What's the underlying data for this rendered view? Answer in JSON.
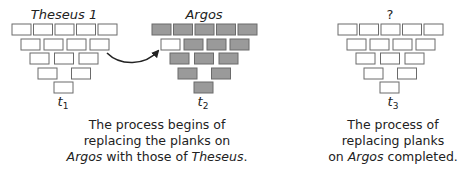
{
  "diagram": {
    "stages": [
      {
        "id": "t1",
        "title": "Theseus 1",
        "title_italic": true,
        "time_label": "t",
        "time_sub": "1",
        "plank_states": [
          [
            "empty",
            "empty",
            "empty",
            "empty",
            "empty"
          ],
          [
            "empty",
            "empty",
            "empty",
            "empty"
          ],
          [
            "empty",
            "empty",
            "empty"
          ],
          [
            "empty",
            "empty"
          ],
          [
            "empty"
          ]
        ]
      },
      {
        "id": "t2",
        "title": "Argos",
        "title_italic": true,
        "time_label": "t",
        "time_sub": "2",
        "plank_states": [
          [
            "filled",
            "filled",
            "filled",
            "filled",
            "filled"
          ],
          [
            "empty",
            "filled",
            "filled",
            "filled"
          ],
          [
            "filled",
            "filled",
            "filled"
          ],
          [
            "filled",
            "filled"
          ],
          [
            "filled"
          ]
        ]
      },
      {
        "id": "t3",
        "title": "?",
        "title_italic": false,
        "time_label": "t",
        "time_sub": "3",
        "plank_states": [
          [
            "empty",
            "empty",
            "empty",
            "empty",
            "empty"
          ],
          [
            "empty",
            "empty",
            "empty",
            "empty"
          ],
          [
            "empty",
            "empty",
            "empty"
          ],
          [
            "empty",
            "empty"
          ],
          [
            "empty"
          ]
        ]
      }
    ],
    "arrow": {
      "from": "t1",
      "to": "t2",
      "label": ""
    },
    "captions": [
      {
        "lines": [
          [
            {
              "text": "The process begins of",
              "italic": false
            }
          ],
          [
            {
              "text": "replacing the planks on",
              "italic": false
            }
          ],
          [
            {
              "text": "Argos",
              "italic": true
            },
            {
              "text": " with those of ",
              "italic": false
            },
            {
              "text": "Theseus",
              "italic": true
            },
            {
              "text": ".",
              "italic": false
            }
          ]
        ]
      },
      {
        "lines": [
          [
            {
              "text": "The process of",
              "italic": false
            }
          ],
          [
            {
              "text": "replacing planks",
              "italic": false
            }
          ],
          [
            {
              "text": "on ",
              "italic": false
            },
            {
              "text": "Argos",
              "italic": true
            },
            {
              "text": " completed.",
              "italic": false
            }
          ]
        ]
      }
    ],
    "colors": {
      "plank_stroke": "#6b6b6b",
      "plank_empty": "#ffffff",
      "plank_filled": "#9a9a9a",
      "arrow": "#222222",
      "text": "#222222"
    }
  }
}
